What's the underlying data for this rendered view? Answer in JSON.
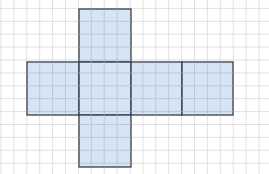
{
  "diagram": {
    "type": "cube-net",
    "grid": {
      "cell_px": 12.9,
      "origin_x": 1,
      "origin_y": -4.5,
      "cols": 21,
      "rows": 14,
      "line_color": "#d9d9d9"
    },
    "faces": [
      {
        "name": "top-face",
        "x": 79,
        "y": 9,
        "w": 52,
        "h": 53
      },
      {
        "name": "left-face",
        "x": 27,
        "y": 62,
        "w": 52,
        "h": 53
      },
      {
        "name": "front-face",
        "x": 79,
        "y": 62,
        "w": 52,
        "h": 53
      },
      {
        "name": "right-face",
        "x": 131,
        "y": 62,
        "w": 51,
        "h": 53
      },
      {
        "name": "back-face",
        "x": 182,
        "y": 62,
        "w": 51,
        "h": 53
      },
      {
        "name": "bottom-face",
        "x": 79,
        "y": 115,
        "w": 52,
        "h": 52
      }
    ],
    "colors": {
      "face_fill": "#cfe1f3",
      "face_stroke": "#3a3f45",
      "background": "#ffffff"
    }
  }
}
